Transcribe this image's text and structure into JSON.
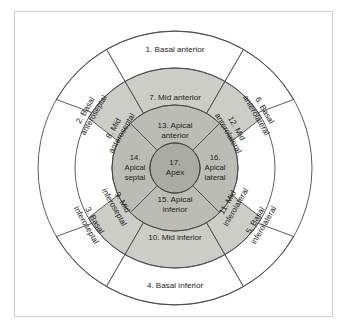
{
  "figure": {
    "background_color": "#ffffff",
    "frame_color": "#cfcfcf",
    "line_color": "#4a4a4a",
    "text_color": "#1c1c1c"
  },
  "chart_data": {
    "type": "pie",
    "title": "",
    "subtitle": "",
    "xlabel": "",
    "ylabel": "",
    "legend_position": "none",
    "grid": false,
    "center": {
      "x": 175,
      "y": 168
    },
    "radii": {
      "outer": 137,
      "basal_inner": 100,
      "mid_inner": 63,
      "apex": 25
    },
    "rings": [
      {
        "name": "basal",
        "fill": "#ffffff",
        "r_outer": 137,
        "r_inner": 100,
        "sector_count": 6,
        "sector_span_deg": 60,
        "start_angle_deg": -30
      },
      {
        "name": "mid",
        "fill": "#cdcdc8",
        "r_outer": 100,
        "r_inner": 63,
        "sector_count": 6,
        "sector_span_deg": 60,
        "start_angle_deg": -30
      },
      {
        "name": "apical",
        "fill": "#bcbcb7",
        "r_outer": 63,
        "r_inner": 25,
        "sector_count": 4,
        "sector_span_deg": 90,
        "start_angle_deg": -45
      },
      {
        "name": "apex",
        "fill": "#ababa6",
        "r_outer": 25,
        "r_inner": 0,
        "sector_count": 1,
        "sector_span_deg": 360,
        "start_angle_deg": 0
      }
    ],
    "categories": [
      "1. Basal anterior",
      "2. Basal anteroseptal",
      "3. Basal inferoseptal",
      "4. Basal inferior",
      "5. Basal inferolateral",
      "6. Basal anterolateral",
      "7. Mid anterior",
      "8. Mid anteroseptal",
      "9. Mid inferoseptal",
      "10. Mid inferior",
      "11. Mid inferolateral",
      "12. Mid anterolateral",
      "13. Apical anterior",
      "14. Apical septal",
      "15. Apical inferior",
      "16. Apical lateral",
      "17. Apex"
    ],
    "values": [
      1,
      2,
      3,
      4,
      5,
      6,
      7,
      8,
      9,
      10,
      11,
      12,
      13,
      14,
      15,
      16,
      17
    ]
  },
  "segments": [
    {
      "number": "1",
      "ring": "basal",
      "lines": [
        "1. Basal anterior"
      ],
      "label_x": 175,
      "label_y": 50,
      "rotation": 0,
      "path": "M 106.5 49.5 A 137 137 0 0 1 243.5 49.5 L 207.0 112.5 A 100 100 0 0 0 143.0 112.5 Z",
      "fill": "#ffffff"
    },
    {
      "number": "2",
      "ring": "basal",
      "lines": [
        "2. Basal",
        "anteroseptal"
      ],
      "label_x": 90,
      "label_y": 113,
      "rotation": -60,
      "path": "M 56.3 99.5 A 137 137 0 0 1 106.5 49.5 L 143.0 112.5 A 100 100 0 0 0 106.4 118.0 Z",
      "fill": "#ffffff"
    },
    {
      "number": "3",
      "ring": "basal",
      "lines": [
        "3. Basal",
        "inferoseptal"
      ],
      "label_x": 90,
      "label_y": 223,
      "rotation": 60,
      "path": "M 106.5 286.5 A 137 137 0 0 1 56.3 236.5 L 106.4 218.0 A 100 100 0 0 0 143.0 223.5 Z",
      "fill": "#ffffff"
    },
    {
      "number": "4",
      "ring": "basal",
      "lines": [
        "4. Basal inferior"
      ],
      "label_x": 175,
      "label_y": 286,
      "rotation": 0,
      "path": "M 243.5 286.5 A 137 137 0 0 1 106.5 286.5 L 143.0 223.5 A 100 100 0 0 0 207.0 223.5 Z",
      "fill": "#ffffff"
    },
    {
      "number": "5",
      "ring": "basal",
      "lines": [
        "5. Basal",
        "inferolateral"
      ],
      "label_x": 260,
      "label_y": 223,
      "rotation": -60,
      "path": "M 293.7 236.5 A 137 137 0 0 1 243.5 286.5 L 207.0 223.5 A 100 100 0 0 0 243.6 218.0 Z",
      "fill": "#ffffff"
    },
    {
      "number": "6",
      "ring": "basal",
      "lines": [
        "6. Basal",
        "anterolateral"
      ],
      "label_x": 260,
      "label_y": 113,
      "rotation": 60,
      "path": "M 243.5 49.5 A 137 137 0 0 1 293.7 99.5 L 243.6 118.0 A 100 100 0 0 0 207.0 112.5 Z",
      "fill": "#ffffff"
    },
    {
      "number": "7",
      "ring": "mid",
      "lines": [
        "7. Mid anterior"
      ],
      "label_x": 175,
      "label_y": 98,
      "rotation": 0,
      "path": "M 125.0 81.4 A 100 100 0 0 1 225.0 81.4 L 200.5 123.9 A 63 63 0 0 0 149.5 123.9 Z",
      "fill": "#cdcdc8"
    },
    {
      "number": "8",
      "ring": "mid",
      "lines": [
        "8. Mid",
        "anteroseptal"
      ],
      "label_x": 118,
      "label_y": 131,
      "rotation": -60,
      "path": "M 88.4 118.0 A 100 100 0 0 1 125.0 81.4 L 149.5 123.9 A 63 63 0 0 0 126.5 147.5 Z",
      "fill": "#cdcdc8"
    },
    {
      "number": "9",
      "ring": "mid",
      "lines": [
        "9. Mid",
        "inferoseptal"
      ],
      "label_x": 118,
      "label_y": 205,
      "rotation": 60,
      "path": "M 125.0 254.6 A 100 100 0 0 1 88.4 218.0 L 126.5 188.5 A 63 63 0 0 0 149.5 212.1 Z",
      "fill": "#cdcdc8"
    },
    {
      "number": "10",
      "ring": "mid",
      "lines": [
        "10.  Mid inferior"
      ],
      "label_x": 175,
      "label_y": 238,
      "rotation": 0,
      "path": "M 225.0 254.6 A 100 100 0 0 1 125.0 254.6 L 149.5 212.1 A 63 63 0 0 0 200.5 212.1 Z",
      "fill": "#cdcdc8"
    },
    {
      "number": "11",
      "ring": "mid",
      "lines": [
        "11. Mid",
        "inferolateral"
      ],
      "label_x": 232,
      "label_y": 205,
      "rotation": -60,
      "path": "M 261.6 218.0 A 100 100 0 0 1 225.0 254.6 L 200.5 212.1 A 63 63 0 0 0 223.5 188.5 Z",
      "fill": "#cdcdc8"
    },
    {
      "number": "12",
      "ring": "mid",
      "lines": [
        "12. Mid",
        "anterolateral"
      ],
      "label_x": 232,
      "label_y": 131,
      "rotation": 60,
      "path": "M 225.0 81.4 A 100 100 0 0 1 261.6 118.0 L 223.5 147.5 A 63 63 0 0 0 200.5 123.9 Z",
      "fill": "#cdcdc8"
    },
    {
      "number": "13",
      "ring": "apical",
      "lines": [
        "13. Apical",
        "anterior"
      ],
      "label_x": 175,
      "label_y": 131,
      "rotation": 0,
      "path": "M 130.4 123.4 A 63 63 0 0 1 219.6 123.4 L 192.7 150.3 A 25 25 0 0 0 157.3 150.3 Z",
      "fill": "#bcbcb7"
    },
    {
      "number": "14",
      "ring": "apical",
      "lines": [
        "14.",
        "Apical",
        "septal"
      ],
      "label_x": 135,
      "label_y": 168,
      "rotation": 0,
      "path": "M 130.4 212.6 A 63 63 0 0 1 130.4 123.4 L 157.3 150.3 A 25 25 0 0 0 157.3 185.7 Z",
      "fill": "#bcbcb7"
    },
    {
      "number": "15",
      "ring": "apical",
      "lines": [
        "15. Apical",
        "inferior"
      ],
      "label_x": 175,
      "label_y": 205,
      "rotation": 0,
      "path": "M 219.6 212.6 A 63 63 0 0 1 130.4 212.6 L 157.3 185.7 A 25 25 0 0 0 192.7 185.7 Z",
      "fill": "#bcbcb7"
    },
    {
      "number": "16",
      "ring": "apical",
      "lines": [
        "16.",
        "Apical",
        "lateral"
      ],
      "label_x": 215,
      "label_y": 168,
      "rotation": 0,
      "path": "M 219.6 123.4 A 63 63 0 0 1 219.6 212.6 L 192.7 185.7 A 25 25 0 0 0 192.7 150.3 Z",
      "fill": "#bcbcb7"
    },
    {
      "number": "17",
      "ring": "apex",
      "lines": [
        "17.",
        "Apex"
      ],
      "label_x": 175,
      "label_y": 168,
      "rotation": 0,
      "path": "M 175 143 A 25 25 0 1 1 174.9 143 Z",
      "fill": "#ababa6"
    }
  ]
}
